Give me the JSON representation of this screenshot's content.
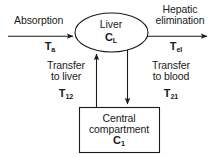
{
  "diagram": {
    "stroke_color": "#1a1a1a",
    "background_color": "#ffffff",
    "nodes": [
      {
        "id": "liver",
        "shape": "ellipse",
        "name": "Liver",
        "concentration": "C",
        "concentration_sub": "L"
      },
      {
        "id": "central-compartment",
        "shape": "rectangle",
        "name_line1": "Central",
        "name_line2": "compartment",
        "concentration": "C",
        "concentration_sub": "1"
      }
    ],
    "flows": {
      "absorption": {
        "label": "Absorption",
        "symbol": "T",
        "symbol_sub": "a",
        "direction": "into-liver"
      },
      "hepatic_elimination": {
        "label_line1": "Hepatic",
        "label_line2": "elimination",
        "symbol": "T",
        "symbol_sub": "el",
        "direction": "out-of-liver"
      },
      "transfer_to_liver": {
        "label_line1": "Transfer",
        "label_line2": "to liver",
        "symbol": "T",
        "symbol_sub": "12",
        "direction": "central-to-liver"
      },
      "transfer_to_blood": {
        "label_line1": "Transfer",
        "label_line2": "to blood",
        "symbol": "T",
        "symbol_sub": "21",
        "direction": "liver-to-central"
      }
    }
  }
}
